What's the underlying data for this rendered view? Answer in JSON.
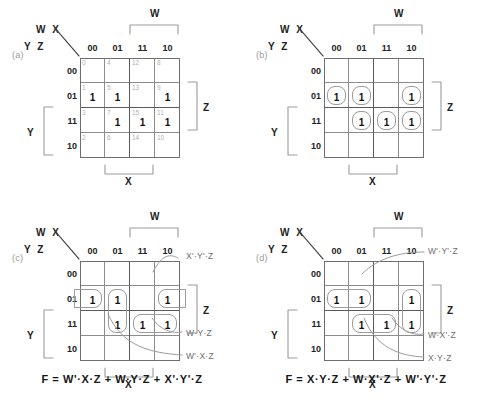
{
  "figure": {
    "col_header_top": "W X",
    "row_header_left": "Y Z",
    "col_labels": [
      "00",
      "01",
      "11",
      "10"
    ],
    "row_labels": [
      "00",
      "01",
      "11",
      "10"
    ],
    "bracket_w": "W",
    "bracket_x": "X",
    "bracket_y": "Y",
    "bracket_z": "Z",
    "minterms": [
      [
        "0",
        "4",
        "12",
        "8"
      ],
      [
        "1",
        "5",
        "13",
        "9"
      ],
      [
        "3",
        "7",
        "15",
        "11"
      ],
      [
        "2",
        "6",
        "14",
        "10"
      ]
    ],
    "one_label": "1",
    "ones": [
      [
        false,
        false,
        false,
        false
      ],
      [
        true,
        true,
        false,
        true
      ],
      [
        false,
        true,
        true,
        true
      ],
      [
        false,
        false,
        false,
        false
      ]
    ]
  },
  "panels": [
    {
      "tag": "(a)",
      "show_minterms": true,
      "show_ones": true,
      "loops": [],
      "annotations": [],
      "equation": ""
    },
    {
      "tag": "(b)",
      "show_minterms": false,
      "show_ones": true,
      "loops": [
        {
          "name": "cell-loop-r01-c00",
          "row": 1,
          "col": 0,
          "rowspan": 1,
          "colspan": 1
        },
        {
          "name": "cell-loop-r01-c01",
          "row": 1,
          "col": 1,
          "rowspan": 1,
          "colspan": 1
        },
        {
          "name": "cell-loop-r01-c10",
          "row": 1,
          "col": 3,
          "rowspan": 1,
          "colspan": 1
        },
        {
          "name": "cell-loop-r11-c01",
          "row": 2,
          "col": 1,
          "rowspan": 1,
          "colspan": 1
        },
        {
          "name": "cell-loop-r11-c11",
          "row": 2,
          "col": 2,
          "rowspan": 1,
          "colspan": 1
        },
        {
          "name": "cell-loop-r11-c10",
          "row": 2,
          "col": 3,
          "rowspan": 1,
          "colspan": 1
        }
      ],
      "annotations": [],
      "equation": ""
    },
    {
      "tag": "(c)",
      "show_minterms": false,
      "show_ones": true,
      "loops": [
        {
          "name": "group-loop-wprime-x-z",
          "row": 1,
          "col": 1,
          "rowspan": 2,
          "colspan": 1
        },
        {
          "name": "group-loop-w-y-z",
          "row": 2,
          "col": 2,
          "rowspan": 1,
          "colspan": 2
        },
        {
          "name": "group-loop-wrap-left",
          "row": 1,
          "col": 0,
          "rowspan": 1,
          "colspan": 1,
          "wrap": "left"
        },
        {
          "name": "group-loop-wrap-right",
          "row": 1,
          "col": 3,
          "rowspan": 1,
          "colspan": 1,
          "wrap": "right"
        }
      ],
      "annotations": [
        {
          "name": "annotation-xprime-yprime-z",
          "text": "X'·Y'·Z",
          "x": 186,
          "y": 251
        },
        {
          "name": "annotation-w-y-z",
          "text": "W·Y·Z",
          "x": 186,
          "y": 328
        },
        {
          "name": "annotation-wprime-x-z",
          "text": "W'·X·Z",
          "x": 186,
          "y": 351
        }
      ],
      "equation": "F  =  W'·X·Z  +  W·Y·Z  +  X'·Y'·Z"
    },
    {
      "tag": "(d)",
      "show_minterms": false,
      "show_ones": true,
      "loops": [
        {
          "name": "group-loop-wprime-yprime-z",
          "row": 1,
          "col": 0,
          "rowspan": 1,
          "colspan": 2
        },
        {
          "name": "group-loop-x-y-z",
          "row": 2,
          "col": 1,
          "rowspan": 1,
          "colspan": 2
        },
        {
          "name": "group-loop-w-xprime-z",
          "row": 1,
          "col": 3,
          "rowspan": 2,
          "colspan": 1
        }
      ],
      "annotations": [
        {
          "name": "annotation-wprime-yprime-z",
          "text": "W'·Y'·Z",
          "x": 428,
          "y": 246
        },
        {
          "name": "annotation-w-xprime-z",
          "text": "W·X'·Z",
          "x": 428,
          "y": 330
        },
        {
          "name": "annotation-x-y-z",
          "text": "X·Y·Z",
          "x": 428,
          "y": 353
        }
      ],
      "equation": "F  =  X·Y·Z  +  W·X'·Z  +  W'·Y'·Z"
    }
  ],
  "colors": {
    "grid_line": "#8d8d8d",
    "grid_frame": "#6e6e6e",
    "quadrant_line": "#5a5a5a",
    "loop_stroke": "#9b9b9b",
    "minterm_text": "#b0b0b0",
    "annotation_text": "#6d6d6d",
    "panel_tag": "#9a9a9a",
    "primary_text": "#161616",
    "background": "#ffffff"
  }
}
